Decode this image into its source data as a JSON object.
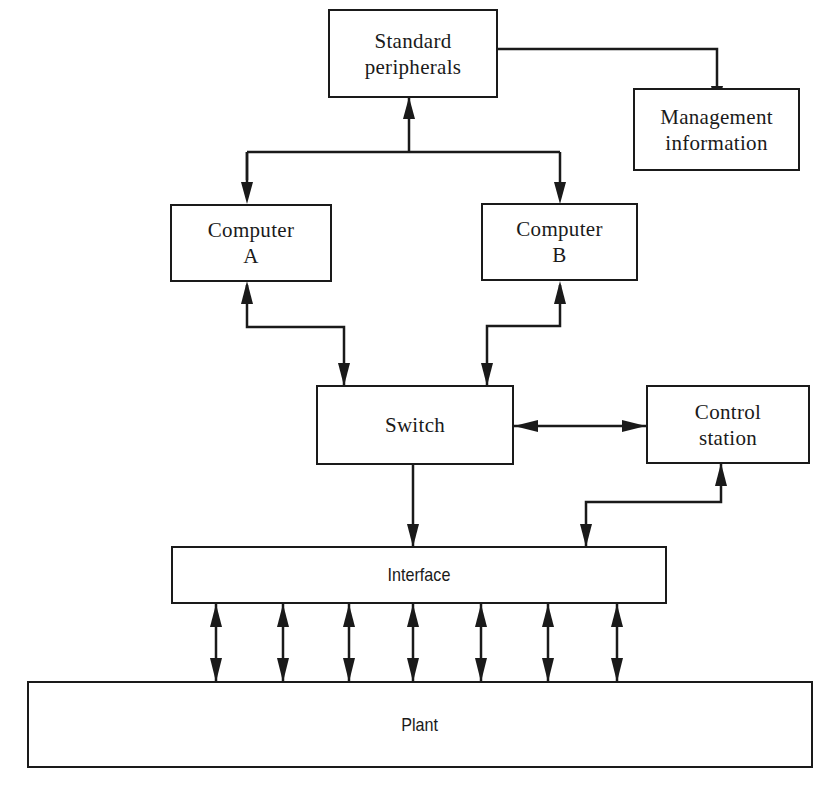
{
  "diagram": {
    "type": "block-diagram",
    "nodes": {
      "standard_peripherals": {
        "line1": "Standard",
        "line2": "peripherals"
      },
      "management_information": {
        "line1": "Management",
        "line2": "information"
      },
      "computer_a": {
        "line1": "Computer",
        "line2": "A"
      },
      "computer_b": {
        "line1": "Computer",
        "line2": "B"
      },
      "switch": {
        "label": "Switch"
      },
      "control_station": {
        "line1": "Control",
        "line2": "station"
      },
      "interface": {
        "label": "Interface"
      },
      "plant": {
        "label": "Plant"
      }
    },
    "edges": [
      {
        "from": "standard_peripherals",
        "to": "management_information",
        "direction": "one-way"
      },
      {
        "from": "computer_a",
        "to": "standard_peripherals",
        "direction": "bidirectional"
      },
      {
        "from": "computer_b",
        "to": "standard_peripherals",
        "direction": "bidirectional"
      },
      {
        "from": "computer_a",
        "to": "switch",
        "direction": "bidirectional"
      },
      {
        "from": "computer_b",
        "to": "switch",
        "direction": "bidirectional"
      },
      {
        "from": "switch",
        "to": "control_station",
        "direction": "bidirectional"
      },
      {
        "from": "switch",
        "to": "interface",
        "direction": "one-way"
      },
      {
        "from": "control_station",
        "to": "interface",
        "direction": "bidirectional"
      },
      {
        "from": "interface",
        "to": "plant",
        "direction": "bidirectional",
        "count": 7
      }
    ],
    "stroke_color": "#1a1a1a",
    "background_color": "#ffffff"
  }
}
